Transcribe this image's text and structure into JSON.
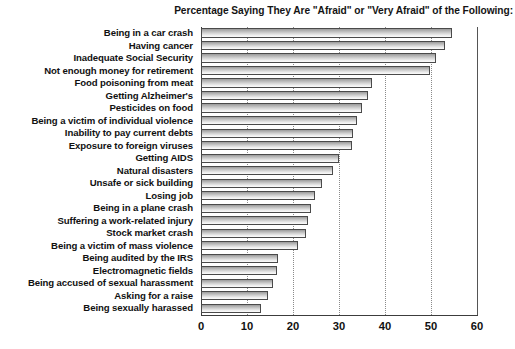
{
  "chart_data": {
    "type": "bar",
    "orientation": "horizontal",
    "title": "Percentage Saying They Are \"Afraid\" or \"Very Afraid\" of the Following:",
    "xlabel": "",
    "ylabel": "",
    "xlim": [
      0,
      60
    ],
    "xticks": [
      0,
      10,
      20,
      30,
      40,
      50,
      60
    ],
    "xtick_labels": [
      "0",
      "10",
      "20",
      "30",
      "40",
      "50",
      "60"
    ],
    "grid": true,
    "grid_axis": "x",
    "legend": false,
    "categories": [
      "Being in a car crash",
      "Having cancer",
      "Inadequate Social Security",
      "Not enough money for retirement",
      "Food poisoning from meat",
      "Getting Alzheimer's",
      "Pesticides on food",
      "Being a victim of individual violence",
      "Inability to pay current debts",
      "Exposure to foreign viruses",
      "Getting AIDS",
      "Natural disasters",
      "Unsafe or sick building",
      "Losing job",
      "Being in a plane crash",
      "Suffering a work-related injury",
      "Stock market crash",
      "Being a victim of mass violence",
      "Being audited by the IRS",
      "Electromagnetic fields",
      "Being accused of sexual harassment",
      "Asking for a raise",
      "Being sexually harassed"
    ],
    "values": [
      54.5,
      53.0,
      51.0,
      49.8,
      37.2,
      36.3,
      35.0,
      34.0,
      33.0,
      32.8,
      30.0,
      28.7,
      26.3,
      24.8,
      24.0,
      23.3,
      22.8,
      21.0,
      16.7,
      16.5,
      15.6,
      14.6,
      13.0
    ],
    "colors": {
      "bar_fill_light": "#fbfbfb",
      "bar_fill_dark": "#9a9a9a",
      "bar_edge": "#4a4a4a",
      "gridline": "#8a8a8a",
      "axis": "#3c3c3c",
      "text": "#111111"
    }
  }
}
